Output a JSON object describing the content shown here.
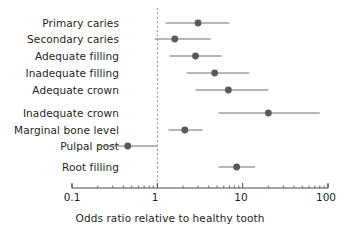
{
  "chart_data": {
    "type": "scatter",
    "plot_style": "forest-plot",
    "title": "",
    "xlabel": "Odds ratio relative to healthy tooth",
    "ylabel": "",
    "xscale": "log",
    "xlim": [
      0.1,
      100
    ],
    "xticks": [
      0.1,
      1,
      10,
      100
    ],
    "xticklabels": [
      "0.1",
      "1",
      "10",
      "100"
    ],
    "grid": false,
    "legend": null,
    "reference_line": {
      "value": 1,
      "style": "dashed",
      "color": "#8c8c8c"
    },
    "marker_color": "#595959",
    "line_color": "#6e6e6e",
    "categories": [
      "Primary caries",
      "Secondary caries",
      "Adequate filling",
      "Inadequate filling",
      "Adequate crown",
      "Inadequate crown",
      "Marginal bone level",
      "Pulpal post",
      "Root filling"
    ],
    "values": [
      3.0,
      1.6,
      2.8,
      4.7,
      6.8,
      20.0,
      2.1,
      0.45,
      8.5
    ],
    "ci_low": [
      1.25,
      0.93,
      1.4,
      2.2,
      2.8,
      5.2,
      1.35,
      0.2,
      5.2
    ],
    "ci_high": [
      7.0,
      4.2,
      5.7,
      12.0,
      20.0,
      80.0,
      3.4,
      1.0,
      14.0
    ],
    "points": [
      {
        "label": "Primary caries",
        "odds_ratio": 3.0,
        "ci_low": 1.25,
        "ci_high": 7.0
      },
      {
        "label": "Secondary caries",
        "odds_ratio": 1.6,
        "ci_low": 0.93,
        "ci_high": 4.2
      },
      {
        "label": "Adequate filling",
        "odds_ratio": 2.8,
        "ci_low": 1.4,
        "ci_high": 5.7
      },
      {
        "label": "Inadequate filling",
        "odds_ratio": 4.7,
        "ci_low": 2.2,
        "ci_high": 12.0
      },
      {
        "label": "Adequate crown",
        "odds_ratio": 6.8,
        "ci_low": 2.8,
        "ci_high": 20.0
      },
      {
        "label": "Inadequate crown",
        "odds_ratio": 20.0,
        "ci_low": 5.2,
        "ci_high": 80.0
      },
      {
        "label": "Marginal bone level",
        "odds_ratio": 2.1,
        "ci_low": 1.35,
        "ci_high": 3.4
      },
      {
        "label": "Pulpal post",
        "odds_ratio": 0.45,
        "ci_low": 0.2,
        "ci_high": 1.0
      },
      {
        "label": "Root filling",
        "odds_ratio": 8.5,
        "ci_low": 5.2,
        "ci_high": 14.0
      }
    ]
  },
  "axis": {
    "title": "Odds ratio relative to healthy tooth",
    "ticks": [
      "0.1",
      "1",
      "100-placeholder",
      "100"
    ],
    "tick_0": "0.1",
    "tick_1": "1",
    "tick_2": "10",
    "tick_3": "100"
  },
  "labels": {
    "row_0": "Primary caries",
    "row_1": "Secondary caries",
    "row_2": "Adequate filling",
    "row_3": "Inadequate filling",
    "row_4": "Adequate crown",
    "row_5": "Inadequate crown",
    "row_6": "Marginal bone level",
    "row_7": "Pulpal post",
    "row_8": "Root filling"
  },
  "colors": {
    "marker": "#595959",
    "whisker": "#6e6e6e",
    "axis": "#4d4d4d",
    "reference": "#8c8c8c",
    "text": "#231f20",
    "background": "#ffffff"
  }
}
